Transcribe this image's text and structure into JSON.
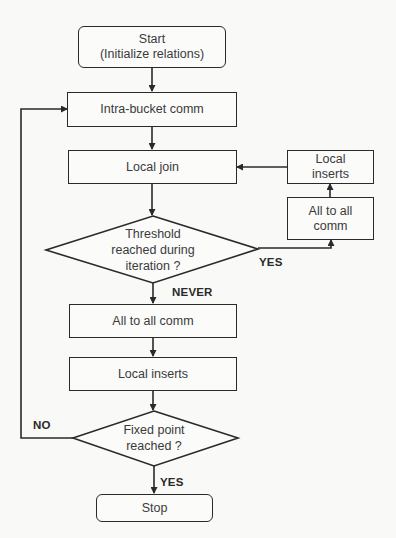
{
  "diagram": {
    "type": "flowchart",
    "nodes": {
      "start": {
        "shape": "rounded-rect",
        "line1": "Start",
        "line2": "(Initialize relations)"
      },
      "intra_bucket_comm": {
        "shape": "rect",
        "label": "Intra-bucket comm"
      },
      "local_join": {
        "shape": "rect",
        "label": "Local join"
      },
      "threshold_decision": {
        "shape": "diamond",
        "line1": "Threshold",
        "line2": "reached during",
        "line3": "iteration ?"
      },
      "side_all_to_all_comm": {
        "shape": "rect",
        "line1": "All to all",
        "line2": "comm"
      },
      "side_local_inserts": {
        "shape": "rect",
        "line1": "Local",
        "line2": "inserts"
      },
      "all_to_all_comm": {
        "shape": "rect",
        "label": "All to all comm"
      },
      "local_inserts": {
        "shape": "rect",
        "label": "Local inserts"
      },
      "fixed_point_decision": {
        "shape": "diamond",
        "line1": "Fixed point",
        "line2": "reached ?"
      },
      "stop": {
        "shape": "rounded-rect",
        "label": "Stop"
      }
    },
    "edge_labels": {
      "threshold_yes": "YES",
      "threshold_never": "NEVER",
      "fixed_point_no": "NO",
      "fixed_point_yes": "YES"
    },
    "edges": [
      {
        "from": "start",
        "to": "intra_bucket_comm"
      },
      {
        "from": "intra_bucket_comm",
        "to": "local_join"
      },
      {
        "from": "local_join",
        "to": "threshold_decision"
      },
      {
        "from": "threshold_decision",
        "to": "side_all_to_all_comm",
        "label": "YES"
      },
      {
        "from": "side_all_to_all_comm",
        "to": "side_local_inserts"
      },
      {
        "from": "side_local_inserts",
        "to": "local_join"
      },
      {
        "from": "threshold_decision",
        "to": "all_to_all_comm",
        "label": "NEVER"
      },
      {
        "from": "all_to_all_comm",
        "to": "local_inserts"
      },
      {
        "from": "local_inserts",
        "to": "fixed_point_decision"
      },
      {
        "from": "fixed_point_decision",
        "to": "intra_bucket_comm",
        "label": "NO"
      },
      {
        "from": "fixed_point_decision",
        "to": "stop",
        "label": "YES"
      }
    ],
    "colors": {
      "line": "#2a2a2a",
      "text": "#3a3a3a",
      "background": "#f9f9f7"
    }
  }
}
